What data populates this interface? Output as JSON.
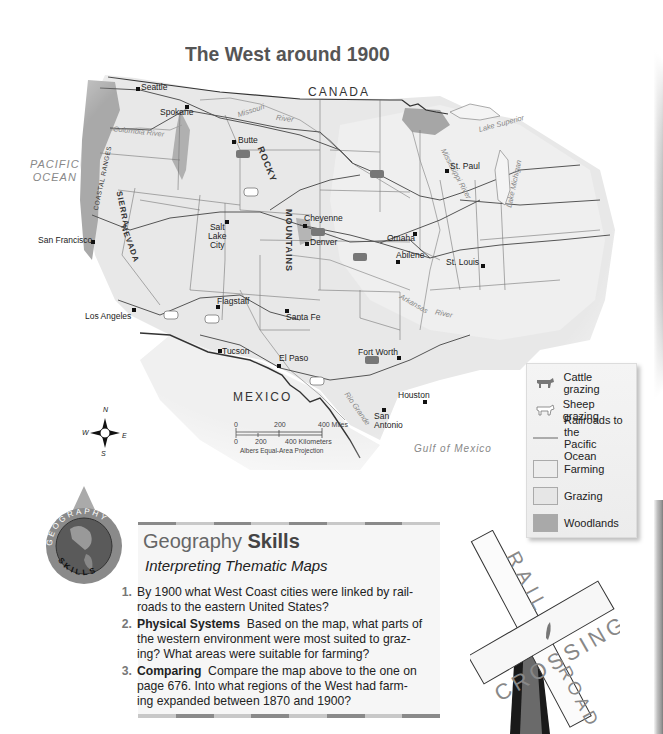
{
  "map": {
    "title": "The West around 1900",
    "countries": {
      "canada": "CANADA",
      "mexico": "MEXICO"
    },
    "water_bodies": {
      "pacific_ocean": [
        "PACIFIC",
        "OCEAN"
      ],
      "gulf_of_mexico": "Gulf of Mexico",
      "lake_superior": "Lake Superior",
      "lake_michigan": "Lake Michigan"
    },
    "rivers": {
      "columbia": "Columbia River",
      "missouri": "Missouri",
      "missouri_river": "River",
      "mississippi": "Mississippi River",
      "arkansas": "Arkansas",
      "arkansas_river": "River",
      "rio_grande": "Rio Grande"
    },
    "mountain_ranges": {
      "coastal": "COASTAL RANGES",
      "sierra": "SIERRA",
      "nevada": "NEVADA",
      "rocky": "ROCKY",
      "mountains": "MOUNTAINS"
    },
    "cities": [
      {
        "name": "Seattle"
      },
      {
        "name": "Spokane"
      },
      {
        "name": "Butte"
      },
      {
        "name": "St. Paul"
      },
      {
        "name": "San Francisco"
      },
      {
        "name": "Salt Lake City",
        "lines": [
          "Salt",
          "Lake",
          "City"
        ]
      },
      {
        "name": "Cheyenne"
      },
      {
        "name": "Denver"
      },
      {
        "name": "Omaha"
      },
      {
        "name": "Abilene"
      },
      {
        "name": "St. Louis"
      },
      {
        "name": "Los Angeles"
      },
      {
        "name": "Flagstaff"
      },
      {
        "name": "Santa Fe"
      },
      {
        "name": "Tucson"
      },
      {
        "name": "El Paso"
      },
      {
        "name": "Fort Worth"
      },
      {
        "name": "Houston"
      },
      {
        "name": "San Antonio",
        "lines": [
          "San",
          "Antonio"
        ]
      }
    ],
    "scale": {
      "miles_ticks": [
        "0",
        "200",
        "400 Miles"
      ],
      "km_ticks": [
        "0",
        "200",
        "400 Kilometers"
      ],
      "projection": "Albers Equal-Area Projection"
    },
    "compass": {
      "n": "N",
      "s": "S",
      "e": "E",
      "w": "W"
    }
  },
  "legend": {
    "items": [
      {
        "icon": "cattle-icon",
        "label": "Cattle grazing"
      },
      {
        "icon": "sheep-icon",
        "label": "Sheep grazing"
      },
      {
        "icon": "railroad-line",
        "label": "Railroads to the Pacific Ocean",
        "lines": [
          "Railroads to the",
          "Pacific Ocean"
        ]
      },
      {
        "swatch": "#ededed",
        "label": "Farming"
      },
      {
        "swatch": "#e6e6e6",
        "label": "Grazing"
      },
      {
        "swatch": "#a9a9a9",
        "label": "Woodlands"
      }
    ]
  },
  "skills": {
    "badge_top": "GEOGRAPHY",
    "badge_bottom": "SKILLS",
    "title_plain": "Geography ",
    "title_bold": "Skills",
    "subtitle": "Interpreting Thematic Maps",
    "questions": [
      {
        "num": "1.",
        "bold": "",
        "text": "By 1900 what West Coast cities were linked by rail-roads to the eastern United States?",
        "lines": [
          "By 1900 what West Coast cities were linked by rail-",
          "roads to the eastern United States?"
        ]
      },
      {
        "num": "2.",
        "bold": "Physical Systems",
        "text": "Based on the map, what parts of the western environment were most suited to grazing? What areas were suitable for farming?",
        "lines": [
          "Based on the map, what parts of",
          "the western environment were most suited to graz-",
          "ing? What areas were suitable for farming?"
        ]
      },
      {
        "num": "3.",
        "bold": "Comparing",
        "text": "Compare the map above to the one on page 676. Into what regions of the West had farming expanded between 1870 and 1900?",
        "lines": [
          "Compare the map above to the one on",
          "page 676. Into what regions of the West had farm-",
          "ing expanded between 1870 and 1900?"
        ]
      }
    ],
    "bar_colors": [
      "#8a8a8a",
      "#c8c8c8"
    ]
  },
  "sign": {
    "top_word": "RAIL",
    "cross_word": "CROSSING",
    "bottom_word": "ROAD"
  }
}
